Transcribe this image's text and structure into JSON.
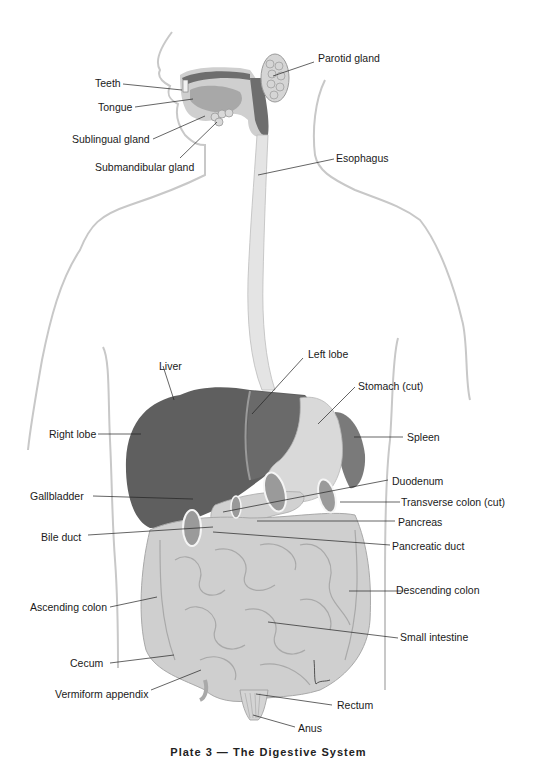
{
  "figure": {
    "caption": "Plate 3 — The Digestive System",
    "colors": {
      "background": "#ffffff",
      "outline": "#c8c8c8",
      "liver": "#5f5f5f",
      "liver_light": "#727272",
      "stomach": "#d9d9d9",
      "spleen": "#7a7a7a",
      "intestine": "#cfcfcf",
      "intestine_shadow": "#a9a9a9",
      "esophagus": "#e4e4e4",
      "mouth_dark": "#6e6e6e",
      "leader_line": "#222222",
      "text": "#1a1a1a"
    }
  },
  "labels": {
    "parotid_gland": "Parotid gland",
    "teeth": "Teeth",
    "tongue": "Tongue",
    "sublingual_gland": "Sublingual gland",
    "submandibular_gland": "Submandibular gland",
    "esophagus": "Esophagus",
    "liver": "Liver",
    "left_lobe": "Left lobe",
    "stomach_cut": "Stomach (cut)",
    "right_lobe": "Right lobe",
    "spleen": "Spleen",
    "duodenum": "Duodenum",
    "gallbladder": "Gallbladder",
    "transverse_colon_cut": "Transverse colon (cut)",
    "pancreas": "Pancreas",
    "bile_duct": "Bile duct",
    "pancreatic_duct": "Pancreatic duct",
    "ascending_colon": "Ascending colon",
    "descending_colon": "Descending colon",
    "small_intestine": "Small intestine",
    "cecum": "Cecum",
    "vermiform_appendix": "Vermiform appendix",
    "rectum": "Rectum",
    "anus": "Anus"
  }
}
